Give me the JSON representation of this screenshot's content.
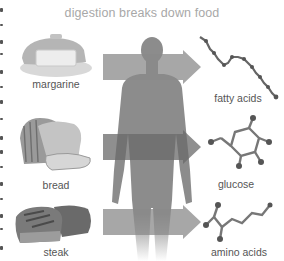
{
  "title": "digestion breaks down food",
  "foods": [
    {
      "label": "margarine",
      "icon": "margarine-tub-icon"
    },
    {
      "label": "bread",
      "icon": "bread-loaf-icon"
    },
    {
      "label": "steak",
      "icon": "steak-icon"
    }
  ],
  "center": {
    "icon": "human-body-silhouette-icon"
  },
  "arrows": [
    {
      "from": "margarine",
      "to": "fatty acids"
    },
    {
      "from": "bread",
      "to": "glucose"
    },
    {
      "from": "steak",
      "to": "amino acids"
    }
  ],
  "products": [
    {
      "label": "fatty acids",
      "icon": "fatty-acid-molecule-icon"
    },
    {
      "label": "glucose",
      "icon": "glucose-molecule-icon"
    },
    {
      "label": "amino acids",
      "icon": "amino-acid-molecule-icon"
    }
  ],
  "colors": {
    "title": "#a8a8a8",
    "label": "#555555",
    "silhouette": "#8a8a8a",
    "arrow": "#9a9a9a"
  }
}
